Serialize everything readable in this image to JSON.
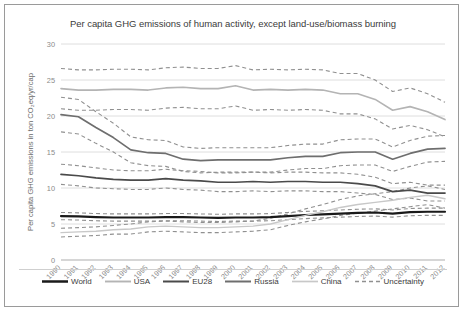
{
  "figure": {
    "title": "Per capita GHG emissions of human activity, except land-use/biomass burning"
  },
  "axes": {
    "ylabel": "Per capita GHG emissions in ton CO₂eq/yr/cap",
    "xlabel": "",
    "yticks": [
      "0",
      "5",
      "10",
      "15",
      "20",
      "25",
      "30"
    ],
    "xticks": [
      "1990",
      "1991",
      "1992",
      "1993",
      "1994",
      "1995",
      "1996",
      "1997",
      "1998",
      "1999",
      "2000",
      "2001",
      "2002",
      "2003",
      "2004",
      "2005",
      "2006",
      "2007",
      "2008",
      "2009",
      "2010",
      "2011",
      "2012"
    ]
  },
  "legend": {
    "position": "bottom",
    "items": [
      {
        "label": "World",
        "color": "#1a1a1a",
        "width": 2.2,
        "dash": "none",
        "icon": "line-swatch-icon"
      },
      {
        "label": "USA",
        "color": "#b4b4b4",
        "width": 1.6,
        "dash": "none",
        "icon": "line-swatch-icon"
      },
      {
        "label": "EU28",
        "color": "#4a4a4a",
        "width": 1.7,
        "dash": "none",
        "icon": "line-swatch-icon"
      },
      {
        "label": "Russia",
        "color": "#6e6e6e",
        "width": 1.7,
        "dash": "none",
        "icon": "line-swatch-icon"
      },
      {
        "label": "China",
        "color": "#c8c8c8",
        "width": 1.4,
        "dash": "none",
        "icon": "line-swatch-icon"
      },
      {
        "label": "Uncertainty",
        "color": "#909090",
        "width": 1.1,
        "dash": "4,3",
        "icon": "dashed-line-swatch-icon"
      }
    ]
  },
  "chart_data": {
    "type": "line",
    "title": "Per capita GHG emissions of human activity, except land-use/biomass burning",
    "xlabel": "",
    "ylabel": "Per capita GHG emissions in ton CO₂eq/yr/cap",
    "x": [
      1990,
      1991,
      1992,
      1993,
      1994,
      1995,
      1996,
      1997,
      1998,
      1999,
      2000,
      2001,
      2002,
      2003,
      2004,
      2005,
      2006,
      2007,
      2008,
      2009,
      2010,
      2011,
      2012
    ],
    "xlim": [
      1990,
      2012
    ],
    "ylim": [
      0,
      30
    ],
    "ytick_step": 5,
    "grid": true,
    "series": [
      {
        "name": "World",
        "color": "#1a1a1a",
        "width": 2.2,
        "values": [
          6.1,
          6.05,
          5.95,
          5.9,
          5.9,
          5.9,
          5.95,
          5.95,
          5.9,
          5.85,
          5.9,
          5.9,
          5.95,
          6.1,
          6.25,
          6.35,
          6.45,
          6.55,
          6.6,
          6.45,
          6.65,
          6.7,
          6.7
        ],
        "uncertainty_upper": [
          6.6,
          6.55,
          6.45,
          6.4,
          6.4,
          6.4,
          6.45,
          6.45,
          6.4,
          6.35,
          6.4,
          6.4,
          6.45,
          6.6,
          6.75,
          6.85,
          6.95,
          7.05,
          7.1,
          6.95,
          7.15,
          7.2,
          7.2
        ],
        "uncertainty_lower": [
          5.6,
          5.55,
          5.45,
          5.4,
          5.4,
          5.4,
          5.45,
          5.45,
          5.4,
          5.35,
          5.4,
          5.4,
          5.45,
          5.6,
          5.75,
          5.85,
          5.95,
          6.05,
          6.1,
          5.95,
          6.15,
          6.2,
          6.2
        ]
      },
      {
        "name": "USA",
        "color": "#b4b4b4",
        "width": 1.6,
        "values": [
          23.8,
          23.6,
          23.6,
          23.7,
          23.7,
          23.6,
          23.9,
          24.0,
          23.8,
          23.8,
          24.2,
          23.6,
          23.7,
          23.6,
          23.7,
          23.6,
          23.1,
          23.1,
          22.3,
          20.8,
          21.3,
          20.6,
          19.5
        ],
        "uncertainty_upper": [
          26.6,
          26.4,
          26.4,
          26.5,
          26.5,
          26.4,
          26.7,
          26.8,
          26.6,
          26.6,
          27.0,
          26.4,
          26.5,
          26.4,
          26.5,
          26.4,
          25.9,
          25.9,
          25.0,
          23.4,
          23.9,
          23.1,
          21.9
        ],
        "uncertainty_lower": [
          21.0,
          20.8,
          20.8,
          20.9,
          20.9,
          20.8,
          21.1,
          21.2,
          21.0,
          21.0,
          21.4,
          20.8,
          20.9,
          20.8,
          20.9,
          20.8,
          20.3,
          20.3,
          19.6,
          18.2,
          18.7,
          18.1,
          17.1
        ]
      },
      {
        "name": "EU28",
        "color": "#4a4a4a",
        "width": 1.7,
        "values": [
          11.9,
          11.7,
          11.4,
          11.2,
          11.1,
          11.1,
          11.3,
          11.1,
          11.0,
          10.8,
          10.8,
          10.9,
          10.8,
          10.9,
          10.9,
          10.8,
          10.8,
          10.6,
          10.3,
          9.5,
          9.7,
          9.3,
          9.3
        ],
        "uncertainty_upper": [
          13.3,
          13.1,
          12.8,
          12.5,
          12.4,
          12.4,
          12.6,
          12.4,
          12.3,
          12.1,
          12.1,
          12.2,
          12.1,
          12.2,
          12.2,
          12.1,
          12.1,
          11.9,
          11.5,
          10.6,
          10.8,
          10.4,
          10.4
        ],
        "uncertainty_lower": [
          10.5,
          10.3,
          10.0,
          9.9,
          9.8,
          9.8,
          10.0,
          9.8,
          9.7,
          9.5,
          9.5,
          9.6,
          9.5,
          9.6,
          9.6,
          9.5,
          9.5,
          9.3,
          9.1,
          8.4,
          8.6,
          8.2,
          8.2
        ]
      },
      {
        "name": "Russia",
        "color": "#6e6e6e",
        "width": 1.7,
        "values": [
          20.2,
          19.9,
          18.4,
          17.0,
          15.3,
          14.9,
          14.8,
          14.0,
          13.8,
          13.9,
          13.9,
          13.9,
          13.9,
          14.2,
          14.4,
          14.4,
          14.9,
          15.0,
          15.0,
          14.0,
          14.8,
          15.4,
          15.5
        ],
        "uncertainty_upper": [
          22.6,
          22.3,
          20.6,
          19.0,
          17.1,
          16.7,
          16.6,
          15.7,
          15.5,
          15.6,
          15.6,
          15.6,
          15.6,
          15.9,
          16.1,
          16.1,
          16.7,
          16.8,
          16.8,
          15.7,
          16.6,
          17.2,
          17.3
        ],
        "uncertainty_lower": [
          17.8,
          17.5,
          16.2,
          15.0,
          13.5,
          13.1,
          13.0,
          12.3,
          12.1,
          12.2,
          12.2,
          12.2,
          12.2,
          12.5,
          12.7,
          12.7,
          13.1,
          13.2,
          13.2,
          12.3,
          13.0,
          13.6,
          13.7
        ]
      },
      {
        "name": "China",
        "color": "#c8c8c8",
        "width": 1.4,
        "values": [
          3.8,
          3.9,
          4.0,
          4.2,
          4.3,
          4.6,
          4.7,
          4.6,
          4.5,
          4.5,
          4.6,
          4.7,
          5.0,
          5.6,
          6.2,
          6.7,
          7.3,
          7.7,
          8.0,
          8.3,
          8.7,
          9.0,
          8.5
        ],
        "uncertainty_upper": [
          4.4,
          4.5,
          4.6,
          4.8,
          5.0,
          5.3,
          5.4,
          5.3,
          5.2,
          5.2,
          5.3,
          5.4,
          5.8,
          6.4,
          7.1,
          7.7,
          8.4,
          8.9,
          9.2,
          9.5,
          10.0,
          10.3,
          9.8
        ],
        "uncertainty_lower": [
          3.2,
          3.3,
          3.4,
          3.6,
          3.6,
          3.9,
          4.0,
          3.9,
          3.8,
          3.8,
          3.9,
          4.0,
          4.2,
          4.8,
          5.3,
          5.7,
          6.2,
          6.5,
          6.8,
          7.1,
          7.4,
          7.7,
          7.2
        ]
      }
    ]
  }
}
